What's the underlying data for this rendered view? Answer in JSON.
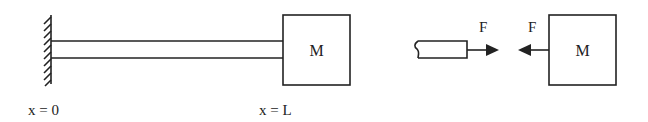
{
  "diagram": {
    "left_figure": {
      "wall": "fixed-wall",
      "beam": "beam",
      "mass_label": "M",
      "x_start_label": "x = 0",
      "x_end_label": "x = L"
    },
    "right_figure": {
      "beam_stub": "cut-beam-end",
      "force_on_beam_label": "F",
      "force_on_mass_label": "F",
      "mass_label": "M"
    },
    "colors": {
      "stroke": "#222222",
      "background": "#ffffff"
    }
  }
}
